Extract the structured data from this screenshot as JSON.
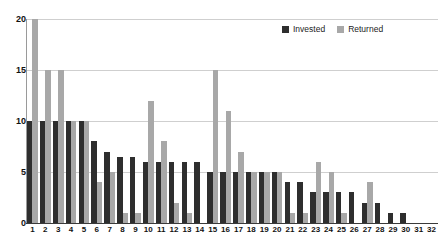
{
  "chart_data": {
    "type": "bar",
    "title": "",
    "subtitle": "",
    "xlabel": "",
    "ylabel": "",
    "ylim": [
      0,
      20
    ],
    "yticks": [
      0,
      5,
      10,
      15,
      20
    ],
    "grid": true,
    "legend_position": "top-right",
    "categories": [
      "1",
      "2",
      "3",
      "4",
      "5",
      "6",
      "7",
      "8",
      "9",
      "10",
      "11",
      "12",
      "13",
      "14",
      "15",
      "16",
      "17",
      "18",
      "19",
      "20",
      "21",
      "22",
      "23",
      "24",
      "25",
      "26",
      "27",
      "28",
      "29",
      "30",
      "31",
      "32"
    ],
    "series": [
      {
        "name": "Invested",
        "color": "#2e2e2e",
        "values": [
          10,
          10,
          10,
          10,
          10,
          8,
          7,
          6.5,
          6.5,
          6,
          6,
          6,
          6,
          6,
          5,
          5,
          5,
          5,
          5,
          5,
          4,
          4,
          3,
          3,
          3,
          3,
          2,
          2,
          1,
          1,
          0,
          0
        ]
      },
      {
        "name": "Returned",
        "color": "#a8a8a8",
        "values": [
          20,
          15,
          15,
          10,
          10,
          4,
          5,
          1,
          1,
          12,
          8,
          2,
          1,
          0,
          15,
          11,
          7,
          5,
          5,
          5,
          1,
          1,
          6,
          5,
          1,
          0,
          4,
          0,
          0,
          0,
          0,
          0
        ]
      }
    ]
  },
  "legend": {
    "entries": [
      {
        "label": "Invested",
        "color": "#2e2e2e"
      },
      {
        "label": "Returned",
        "color": "#a8a8a8"
      }
    ]
  },
  "axes": {
    "y_tick_labels": [
      "20",
      "15",
      "10",
      "5",
      "0"
    ],
    "x_tick_labels": [
      "1",
      "2",
      "3",
      "4",
      "5",
      "6",
      "7",
      "8",
      "9",
      "10",
      "11",
      "12",
      "13",
      "14",
      "15",
      "16",
      "17",
      "18",
      "19",
      "20",
      "21",
      "22",
      "23",
      "24",
      "25",
      "26",
      "27",
      "28",
      "29",
      "30",
      "31",
      "32"
    ]
  }
}
